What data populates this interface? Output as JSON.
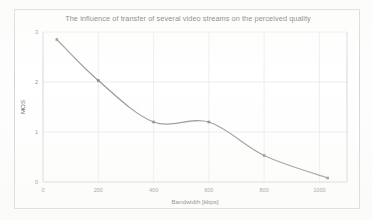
{
  "chart_data": {
    "type": "line",
    "title": "The influence of transfer of several video streams on the perceived quality",
    "xlabel": "Bandwidth [kbps]",
    "ylabel": "MOS",
    "x": [
      50,
      200,
      400,
      600,
      800,
      1030
    ],
    "values": [
      2.85,
      2.03,
      1.2,
      1.2,
      0.53,
      0.08
    ],
    "series": [
      {
        "name": "MOS",
        "values": [
          2.85,
          2.03,
          1.2,
          1.2,
          0.53,
          0.08
        ]
      }
    ],
    "xtick_labels": [
      "0",
      "200",
      "400",
      "600",
      "800",
      "1000"
    ],
    "xtick_values": [
      0,
      200,
      400,
      600,
      800,
      1000
    ],
    "ytick_labels": [
      "0",
      "1",
      "2",
      "3"
    ],
    "ytick_values": [
      0,
      1,
      2,
      3
    ],
    "xlim": [
      0,
      1100
    ],
    "ylim": [
      0,
      3
    ],
    "grid": "horizontal-and-vertical",
    "legend": "none",
    "line_color": "#7b7b7b",
    "marker_color": "#6a6a6a",
    "grid_color": "#d6d6d6",
    "axis_color": "#b4b4b4",
    "background_color": "#ffffff",
    "smoothed": true
  }
}
